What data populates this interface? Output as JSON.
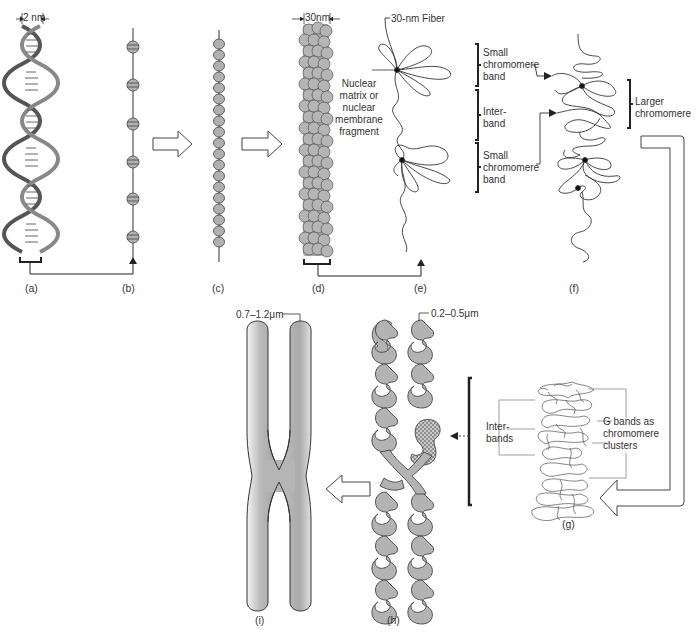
{
  "figure": {
    "panels": [
      {
        "id": "a",
        "label": "(a)",
        "depicts": "DNA double helix"
      },
      {
        "id": "b",
        "label": "(b)",
        "depicts": "Nucleosomes on DNA (beads on a string)"
      },
      {
        "id": "c",
        "label": "(c)",
        "depicts": "Condensed nucleosome string"
      },
      {
        "id": "d",
        "label": "(d)",
        "depicts": "30-nm fiber (solenoid)"
      },
      {
        "id": "e",
        "label": "(e)",
        "depicts": "Loops of 30-nm fiber anchored to nuclear matrix"
      },
      {
        "id": "f",
        "label": "(f)",
        "depicts": "Larger chromomere"
      },
      {
        "id": "g",
        "label": "(g)",
        "depicts": "G bands as chromomere clusters"
      },
      {
        "id": "h",
        "label": "(h)",
        "depicts": "Coiled chromatids"
      },
      {
        "id": "i",
        "label": "(i)",
        "depicts": "Metaphase chromosome"
      }
    ],
    "annotations": {
      "dna_width": "2 nm",
      "fiber_width": "30nm",
      "fiber_label": "30-nm Fiber",
      "nuclear_matrix": [
        "Nuclear",
        "matrix or",
        "nuclear",
        "membrane",
        "fragment"
      ],
      "small_chromomere_band_1": [
        "Small",
        "chromomere",
        "band"
      ],
      "interband": [
        "Inter-",
        "band"
      ],
      "small_chromomere_band_2": [
        "Small",
        "chromomere",
        "band"
      ],
      "larger_chromomere": [
        "Larger",
        "chromomere"
      ],
      "interbands": [
        "Inter-",
        "bands"
      ],
      "g_bands": [
        "G bands as",
        "chromomere",
        "clusters"
      ],
      "chromatid_width": "0.2–0.5μm",
      "chromosome_width": "0.7–1.2μm"
    },
    "colors": {
      "fill_gray": "#b8b8b8",
      "stroke": "#333333",
      "background": "#ffffff"
    }
  }
}
